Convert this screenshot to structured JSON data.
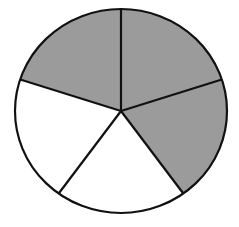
{
  "figure": {
    "total_parts": 5,
    "shaded_parts": 3,
    "fraction_shaded": "3/5",
    "colors": {
      "shaded": "#9b9b9b",
      "unshaded": "#ffffff",
      "stroke": "#111111",
      "background": "#ffffff"
    }
  },
  "chart_data": {
    "type": "pie",
    "title": "",
    "categories": [
      "Sector 1",
      "Sector 2",
      "Sector 3",
      "Sector 4",
      "Sector 5"
    ],
    "values": [
      1,
      1,
      1,
      1,
      1
    ],
    "shaded": [
      true,
      true,
      false,
      false,
      true
    ],
    "note": "Sectors listed clockwise from top; sectors top-right, right and top-left are shaded"
  }
}
